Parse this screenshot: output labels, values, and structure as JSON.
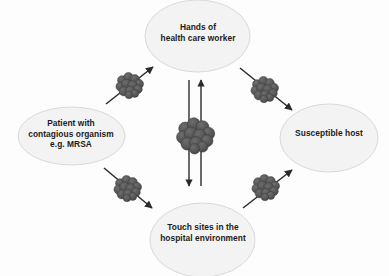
{
  "diagram": {
    "nodes": [
      {
        "id": "hands",
        "label": "Hands of\nhealth care worker"
      },
      {
        "id": "patient",
        "label": "Patient with\ncontagious organism\ne.g. MRSA"
      },
      {
        "id": "host",
        "label": "Susceptible host"
      },
      {
        "id": "touch",
        "label": "Touch sites in the\nhospital environment"
      }
    ],
    "arrows": [
      {
        "id": "patient-to-hands",
        "from": "patient",
        "to": "hands",
        "direction": "up-right",
        "carries_organism": true
      },
      {
        "id": "hands-to-host",
        "from": "hands",
        "to": "host",
        "direction": "down-right",
        "carries_organism": true
      },
      {
        "id": "patient-to-touch",
        "from": "patient",
        "to": "touch",
        "direction": "down-right",
        "carries_organism": true
      },
      {
        "id": "touch-to-host",
        "from": "touch",
        "to": "host",
        "direction": "up-right",
        "carries_organism": true
      },
      {
        "id": "hands-to-touch-down",
        "from": "hands",
        "to": "touch",
        "direction": "down",
        "carries_organism": true
      },
      {
        "id": "touch-to-hands-up",
        "from": "touch",
        "to": "hands",
        "direction": "up",
        "carries_organism": true
      }
    ],
    "organism_clusters": [
      {
        "id": "cluster-upper-left",
        "on_arrow": "patient-to-hands"
      },
      {
        "id": "cluster-upper-right",
        "on_arrow": "hands-to-host"
      },
      {
        "id": "cluster-lower-left",
        "on_arrow": "patient-to-touch"
      },
      {
        "id": "cluster-lower-right",
        "on_arrow": "touch-to-host"
      },
      {
        "id": "cluster-center",
        "on_arrow": "hands-to-touch-down"
      }
    ],
    "colors": {
      "background": "#fdfdfd",
      "ellipse_fill": "#f3f3f3",
      "ellipse_stroke": "#d7d7d7",
      "arrow": "#2b2b2b",
      "organism": "#555555",
      "organism_stroke": "#3a3a3a",
      "text": "#1c1c1c"
    }
  }
}
